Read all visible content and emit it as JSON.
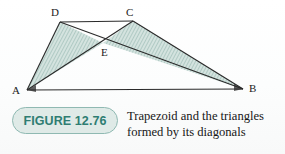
{
  "figure": {
    "badge_label": "FIGURE 12.76",
    "caption_line_1": "Trapezoid and the triangles",
    "caption_line_2": "formed by its diagonals",
    "accent_color": "#2e7d72",
    "badge_fill_color": "#dfeae7",
    "badge_border_color": "#8fb9b2",
    "line_color": "#2a2a2a",
    "shade_fill_color": "#cfe0dc",
    "hatch_line_color": "#8fb2ab",
    "background_color": "#fdfdfd"
  },
  "diagram": {
    "type": "geometry",
    "shape": "trapezoid",
    "vertices": [
      {
        "id": "D",
        "label": "D",
        "x": 60,
        "y": 22,
        "label_x": 51,
        "label_y": 7
      },
      {
        "id": "C",
        "label": "C",
        "x": 133,
        "y": 21,
        "label_x": 126,
        "label_y": 7
      },
      {
        "id": "A",
        "label": "A",
        "x": 27,
        "y": 90,
        "label_x": 12,
        "label_y": 85
      },
      {
        "id": "B",
        "label": "B",
        "x": 243,
        "y": 89,
        "label_x": 249,
        "label_y": 83
      },
      {
        "id": "E",
        "label": "E",
        "x": 103,
        "y": 43,
        "label_x": 101,
        "label_y": 47
      }
    ],
    "segments": [
      {
        "id": "DC",
        "from": "D",
        "to": "C"
      },
      {
        "id": "AB",
        "from": "A",
        "to": "B"
      },
      {
        "id": "AD",
        "from": "A",
        "to": "D"
      },
      {
        "id": "CB",
        "from": "C",
        "to": "B"
      },
      {
        "id": "AC",
        "from": "A",
        "to": "C"
      },
      {
        "id": "DB",
        "from": "D",
        "to": "B"
      }
    ],
    "shaded_triangles": [
      {
        "id": "ADE",
        "vertices": [
          "A",
          "D",
          "E"
        ]
      },
      {
        "id": "CEB",
        "vertices": [
          "C",
          "E",
          "B"
        ]
      }
    ]
  }
}
